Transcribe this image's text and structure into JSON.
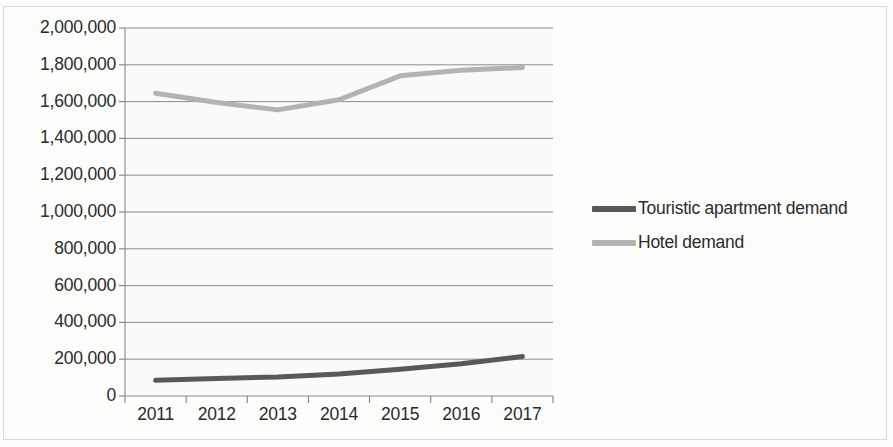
{
  "chart_data": {
    "type": "line",
    "title": "",
    "subtitle": "",
    "xlabel": "",
    "ylabel": "",
    "categories": [
      "2011",
      "2012",
      "2013",
      "2014",
      "2015",
      "2016",
      "2017"
    ],
    "series": [
      {
        "name": "Touristic apartment demand",
        "color": "#595959",
        "values": [
          85000,
          95000,
          103000,
          120000,
          145000,
          175000,
          215000
        ]
      },
      {
        "name": "Hotel demand",
        "color": "#b3b3b3",
        "values": [
          1645000,
          1595000,
          1555000,
          1610000,
          1740000,
          1770000,
          1785000
        ]
      }
    ],
    "ylim": [
      0,
      2000000
    ],
    "y_ticks": [
      0,
      200000,
      400000,
      600000,
      800000,
      1000000,
      1200000,
      1400000,
      1600000,
      1800000,
      2000000
    ],
    "y_tick_labels": [
      "0",
      "200,000",
      "400,000",
      "600,000",
      "800,000",
      "1,000,000",
      "1,200,000",
      "1,400,000",
      "1,600,000",
      "1,800,000",
      "2,000,000"
    ],
    "grid": true,
    "grid_axis": "y",
    "grid_color": "#808080",
    "axis_color": "#808080",
    "plot_background": "#fafafa",
    "legend_position": "right"
  },
  "legend": {
    "entries": [
      {
        "label": "Touristic apartment demand",
        "color": "#595959"
      },
      {
        "label": "Hotel demand",
        "color": "#b3b3b3"
      }
    ]
  }
}
